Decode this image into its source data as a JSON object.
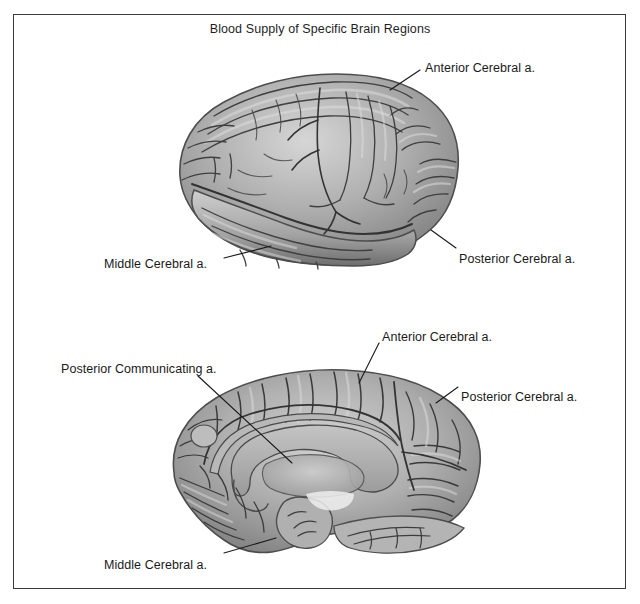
{
  "figure": {
    "title": "Blood Supply of Specific Brain Regions",
    "border_color": "#3a3a3a",
    "background_color": "#ffffff",
    "text_color": "#1a1a1a",
    "width": 640,
    "height": 604
  },
  "panels": [
    {
      "id": "lateral-view",
      "view_name": "lateral-surface-of-cerebral-hemisphere",
      "labels": [
        {
          "id": "lateral-anterior-cerebral",
          "text": "Anterior Cerebral a.",
          "x": 425,
          "y": 61,
          "leader": {
            "x1": 420,
            "y1": 70,
            "x2": 390,
            "y2": 90
          }
        },
        {
          "id": "lateral-middle-cerebral",
          "text": "Middle Cerebral a.",
          "x": 104,
          "y": 257,
          "leader": {
            "x1": 224,
            "y1": 258,
            "x2": 271,
            "y2": 246
          }
        },
        {
          "id": "lateral-posterior-cerebral",
          "text": "Posterior Cerebral a.",
          "x": 459,
          "y": 252,
          "leader": {
            "x1": 456,
            "y1": 248,
            "x2": 431,
            "y2": 230
          }
        }
      ]
    },
    {
      "id": "medial-view",
      "view_name": "medial-surface-of-cerebral-hemisphere",
      "labels": [
        {
          "id": "medial-anterior-cerebral",
          "text": "Anterior Cerebral a.",
          "x": 382,
          "y": 330,
          "leader": {
            "x1": 379,
            "y1": 343,
            "x2": 359,
            "y2": 383
          }
        },
        {
          "id": "medial-posterior-communicating",
          "text": "Posterior Communicating a.",
          "x": 61,
          "y": 362,
          "leader": {
            "x1": 198,
            "y1": 376,
            "x2": 292,
            "y2": 463
          }
        },
        {
          "id": "medial-posterior-cerebral",
          "text": "Posterior Cerebral a.",
          "x": 461,
          "y": 390,
          "leader": {
            "x1": 458,
            "y1": 387,
            "x2": 436,
            "y2": 403
          }
        },
        {
          "id": "medial-middle-cerebral",
          "text": "Middle Cerebral a.",
          "x": 104,
          "y": 558,
          "leader": {
            "x1": 224,
            "y1": 553,
            "x2": 276,
            "y2": 538
          }
        }
      ]
    }
  ],
  "palette": {
    "cortex_light": "#cfcfcf",
    "cortex_mid": "#9c9c9c",
    "cortex_dark": "#6b6b6b",
    "sulcus": "#3d3d3d",
    "outline": "#4a4a4a",
    "corpus_callosum": "#b4b4b4",
    "leader_line": "#1a1a1a"
  }
}
